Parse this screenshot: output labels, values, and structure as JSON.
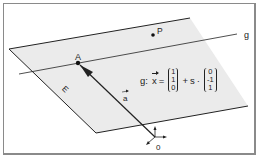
{
  "diagram": {
    "plane_label": "E",
    "line_label": "g",
    "point_a_label": "A",
    "point_p_label": "P",
    "vector_label": "a",
    "origin_label": "0",
    "colors": {
      "plane_fill": "#ebebeb",
      "stroke": "#222222",
      "frame": "#8a8a8a"
    },
    "equation": {
      "name": "g:",
      "lhs": "x",
      "equals": "=",
      "support_vector": [
        "1",
        "1",
        "0"
      ],
      "plus": "+",
      "parameter": "s",
      "dot": "·",
      "direction_vector": [
        "0",
        "-1",
        "1"
      ]
    }
  }
}
